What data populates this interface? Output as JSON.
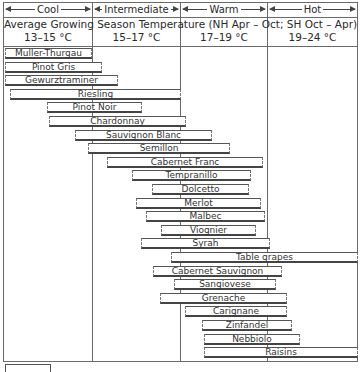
{
  "chart_data": {
    "type": "bar",
    "orientation": "horizontal-range",
    "zones": [
      {
        "name": "Cool",
        "range_label": "13–15 °C",
        "min": 13,
        "max": 15
      },
      {
        "name": "Intermediate",
        "range_label": "15–17 °C",
        "min": 15,
        "max": 17
      },
      {
        "name": "Warm",
        "range_label": "17–19 °C",
        "min": 17,
        "max": 19
      },
      {
        "name": "Hot",
        "range_label": "19–24 °C",
        "min": 19,
        "max": 24
      }
    ],
    "xlabel": "Average Growing Season Temperature (°C)",
    "grid": true,
    "categories": [
      "Muller-Thurgau",
      "Pinot Gris",
      "Gewurztraminer",
      "Riesling",
      "Pinot Noir",
      "Chardonnay",
      "Sauvignon Blanc",
      "Semillon",
      "Cabernet Franc",
      "Tempranillo",
      "Dolcetto",
      "Merlot",
      "Malbec",
      "Viognier",
      "Syrah",
      "Table grapes",
      "Cabernet Sauvignon",
      "Sangiovese",
      "Grenache",
      "Carignane",
      "Zinfandel",
      "Nebbiolo",
      "Raisins"
    ],
    "series": [
      {
        "name": "min_temp_C",
        "values": [
          13.0,
          13.0,
          13.0,
          13.2,
          14.0,
          14.1,
          14.6,
          14.9,
          15.3,
          15.9,
          16.4,
          16.0,
          16.3,
          16.6,
          16.1,
          16.8,
          16.4,
          16.9,
          16.6,
          17.2,
          17.5,
          17.6,
          17.6
        ]
      },
      {
        "name": "max_temp_C",
        "values": [
          15.0,
          15.2,
          15.6,
          17.0,
          16.1,
          17.1,
          17.7,
          18.1,
          18.9,
          18.6,
          18.6,
          18.8,
          19.0,
          18.7,
          19.0,
          24.0,
          19.8,
          19.5,
          20.2,
          20.1,
          20.3,
          20.8,
          24.0
        ]
      }
    ]
  },
  "header": {
    "zones": [
      {
        "label": "Cool",
        "range": "13–15 °C"
      },
      {
        "label": "Intermediate",
        "range": "15–17 °C"
      },
      {
        "label": "Warm",
        "range": "17–19 °C"
      },
      {
        "label": "Hot",
        "range": "19–24 °C"
      }
    ],
    "subtitle": "Average Growing Season Temperature (NH Apr – Oct; SH Oct – Apr)"
  },
  "bars": [
    {
      "label": "Muller-Thurgau",
      "x1": 5,
      "x2": 92
    },
    {
      "label": "Pinot Gris",
      "x1": 5,
      "x2": 102
    },
    {
      "label": "Gewurztraminer",
      "x1": 5,
      "x2": 118
    },
    {
      "label": "Riesling",
      "x1": 10,
      "x2": 181
    },
    {
      "label": "Pinot Noir",
      "x1": 47,
      "x2": 142
    },
    {
      "label": "Chardonnay",
      "x1": 49,
      "x2": 186
    },
    {
      "label": "Sauvignon Blanc",
      "x1": 75,
      "x2": 212
    },
    {
      "label": "Semillon",
      "x1": 88,
      "x2": 230
    },
    {
      "label": "Cabernet Franc",
      "x1": 107,
      "x2": 263
    },
    {
      "label": "Tempranillo",
      "x1": 132,
      "x2": 251
    },
    {
      "label": "Dolcetto",
      "x1": 152,
      "x2": 249
    },
    {
      "label": "Merlot",
      "x1": 136,
      "x2": 261
    },
    {
      "label": "Malbec",
      "x1": 146,
      "x2": 265
    },
    {
      "label": "Viognier",
      "x1": 161,
      "x2": 256
    },
    {
      "label": "Syrah",
      "x1": 141,
      "x2": 270
    },
    {
      "label": "Table grapes",
      "x1": 171,
      "x2": 358
    },
    {
      "label": "Cabernet Sauvignon",
      "x1": 153,
      "x2": 282
    },
    {
      "label": "Sangiovese",
      "x1": 174,
      "x2": 276
    },
    {
      "label": "Grenache",
      "x1": 160,
      "x2": 287
    },
    {
      "label": "Carignane",
      "x1": 185,
      "x2": 287
    },
    {
      "label": "Zinfandel",
      "x1": 202,
      "x2": 292
    },
    {
      "label": "Nebbiolo",
      "x1": 204,
      "x2": 300
    },
    {
      "label": "Raisins",
      "x1": 204,
      "x2": 358
    }
  ]
}
